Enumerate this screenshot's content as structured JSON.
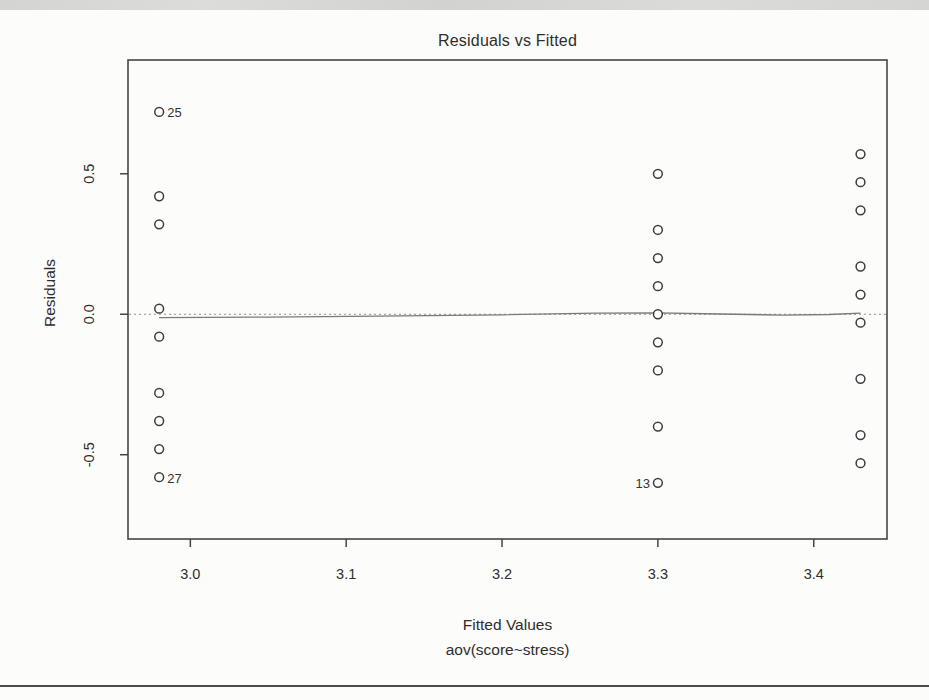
{
  "page": {
    "top_band_color": "#d6d6d4",
    "bottom_rule_color": "#4c4c4c",
    "background": "#fcfcfa",
    "ink_color": "#2e2e2e"
  },
  "chart_data": {
    "type": "scatter",
    "title": "Residuals vs Fitted",
    "xlabel": "Fitted Values",
    "sublabel": "aov(score~stress)",
    "ylabel": "Residuals",
    "xlim": [
      2.96,
      3.447
    ],
    "ylim": [
      -0.8,
      0.905
    ],
    "x_ticks": [
      3.0,
      3.1,
      3.2,
      3.3,
      3.4
    ],
    "x_tick_labels": [
      "3.0",
      "3.1",
      "3.2",
      "3.3",
      "3.4"
    ],
    "y_ticks": [
      0.5,
      0.0,
      -0.5
    ],
    "y_tick_labels": [
      "0.5",
      "0.0",
      "-0.5"
    ],
    "grid": false,
    "legend": false,
    "zero_line": {
      "residual": 0,
      "style": "dotted"
    },
    "point_style": {
      "marker": "open-circle",
      "radius": 4.4,
      "stroke": "#3d3d3d"
    },
    "line_colors": {
      "axis": "#454545",
      "zero_dotted": "#8f8f8f",
      "smoother": "#7a7a7a"
    },
    "groups": [
      {
        "fitted": 2.98,
        "residuals": [
          0.72,
          0.42,
          0.32,
          0.02,
          -0.08,
          -0.28,
          -0.38,
          -0.48,
          -0.58
        ]
      },
      {
        "fitted": 3.3,
        "residuals": [
          0.5,
          0.3,
          0.2,
          0.1,
          0.0,
          -0.1,
          -0.2,
          -0.4,
          -0.6
        ]
      },
      {
        "fitted": 3.43,
        "residuals": [
          0.57,
          0.47,
          0.37,
          0.17,
          0.07,
          -0.03,
          -0.23,
          -0.43,
          -0.53
        ]
      }
    ],
    "labeled_points": [
      {
        "label": "25",
        "fitted": 2.98,
        "residual": 0.72,
        "side": "right"
      },
      {
        "label": "27",
        "fitted": 2.98,
        "residual": -0.58,
        "side": "right"
      },
      {
        "label": "13",
        "fitted": 3.3,
        "residual": -0.6,
        "side": "left"
      }
    ],
    "smoother": [
      [
        2.98,
        -0.012
      ],
      [
        3.05,
        -0.01
      ],
      [
        3.12,
        -0.007
      ],
      [
        3.2,
        -0.002
      ],
      [
        3.26,
        0.004
      ],
      [
        3.3,
        0.005
      ],
      [
        3.34,
        0.001
      ],
      [
        3.38,
        -0.003
      ],
      [
        3.41,
        -0.001
      ],
      [
        3.43,
        0.004
      ]
    ]
  }
}
